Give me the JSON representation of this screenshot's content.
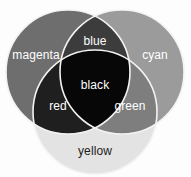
{
  "figure": {
    "width": 191,
    "height": 177,
    "background_color": "#fdfdfd",
    "outline_color": "#f2f2f2"
  },
  "chart_data": {
    "type": "venn",
    "title": "",
    "xlabel": "",
    "ylabel": "",
    "sets": [
      {
        "name": "magenta",
        "label": "magenta",
        "fill": "#6e6e6e",
        "text_color": "#ffffff",
        "cx": 68,
        "cy": 72,
        "r": 62,
        "label_x": 36,
        "label_y": 56
      },
      {
        "name": "cyan",
        "label": "cyan",
        "fill": "#9b9b9b",
        "text_color": "#ffffff",
        "cx": 122,
        "cy": 72,
        "r": 62,
        "label_x": 155,
        "label_y": 56
      },
      {
        "name": "yellow",
        "label": "yellow",
        "fill": "#e3e3e3",
        "text_color": "#1c1c1c",
        "cx": 95,
        "cy": 112,
        "r": 62,
        "label_x": 95,
        "label_y": 152
      }
    ],
    "intersections": [
      {
        "name": "blue",
        "label": "blue",
        "sets": [
          "magenta",
          "cyan"
        ],
        "fill": "#3c3c3c",
        "text_color": "#ffffff",
        "label_x": 95,
        "label_y": 42
      },
      {
        "name": "red",
        "label": "red",
        "sets": [
          "magenta",
          "yellow"
        ],
        "fill": "#1f1f1f",
        "text_color": "#ffffff",
        "label_x": 58,
        "label_y": 107
      },
      {
        "name": "green",
        "label": "green",
        "sets": [
          "cyan",
          "yellow"
        ],
        "fill": "#7e7e7e",
        "text_color": "#ffffff",
        "label_x": 130,
        "label_y": 107
      },
      {
        "name": "black",
        "label": "black",
        "sets": [
          "magenta",
          "cyan",
          "yellow"
        ],
        "fill": "#070707",
        "text_color": "#ffffff",
        "label_x": 95,
        "label_y": 86
      }
    ],
    "font_sizes": {
      "set_label": 12,
      "intersection_label": 12
    }
  }
}
